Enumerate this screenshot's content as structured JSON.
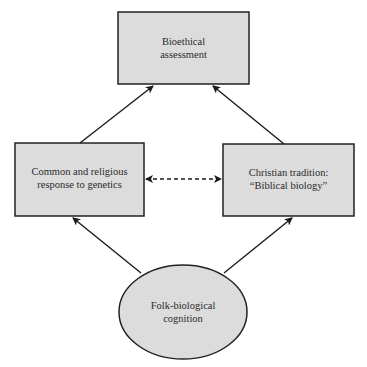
{
  "diagram": {
    "nodes": [
      {
        "id": "bioethical",
        "shape": "rect",
        "lines": [
          "Bioethical",
          "assessment"
        ]
      },
      {
        "id": "common",
        "shape": "rect",
        "lines": [
          "Common and religious",
          "response to genetics"
        ]
      },
      {
        "id": "christian",
        "shape": "rect",
        "lines": [
          "Christian tradition:",
          "“Biblical biology”"
        ]
      },
      {
        "id": "folk",
        "shape": "ellipse",
        "lines": [
          "Folk-biological",
          "cognition"
        ]
      }
    ],
    "edges": [
      {
        "from": "common",
        "to": "bioethical",
        "style": "solid",
        "direction": "forward"
      },
      {
        "from": "christian",
        "to": "bioethical",
        "style": "solid",
        "direction": "forward"
      },
      {
        "from": "folk",
        "to": "common",
        "style": "solid",
        "direction": "forward"
      },
      {
        "from": "folk",
        "to": "christian",
        "style": "solid",
        "direction": "forward"
      },
      {
        "from": "common",
        "to": "christian",
        "style": "dashed",
        "direction": "both"
      }
    ],
    "colors": {
      "fill": "#dcdcdc",
      "stroke": "#222222",
      "text": "#2b2b2b"
    }
  }
}
